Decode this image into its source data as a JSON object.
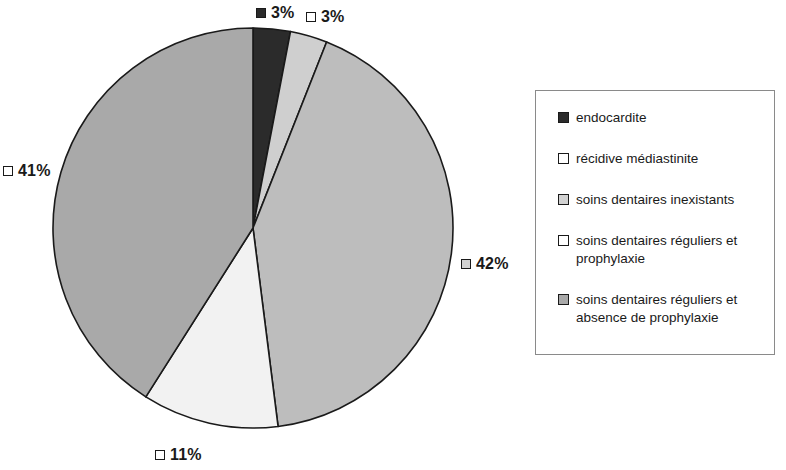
{
  "chart_data": {
    "type": "pie",
    "title": "",
    "subtitle": "",
    "xlabel": "",
    "ylabel": "",
    "grid": false,
    "legend_position": "right",
    "start_angle_deg": 0,
    "direction": "clockwise",
    "units": "percent",
    "categories": [
      "endocardite",
      "récidive médiastinite",
      "soins dentaires inexistants",
      "soins dentaires réguliers et prophylaxie",
      "soins dentaires réguliers et absence de prophylaxie"
    ],
    "values": [
      3,
      3,
      42,
      11,
      41
    ],
    "data_labels": [
      "3%",
      "3%",
      "42%",
      "11%",
      "41%"
    ],
    "colors": [
      "#2b2b2b",
      "#cfcfcf",
      "#bdbdbd",
      "#f2f2f2",
      "#a9a9a9"
    ],
    "slice_border_color": "#1a1a1a",
    "slices": [
      {
        "label": "endocardite",
        "value": 3,
        "data_label": "3%",
        "color": "#2b2b2b"
      },
      {
        "label": "récidive médiastinite",
        "value": 3,
        "data_label": "3%",
        "color": "#cfcfcf"
      },
      {
        "label": "soins dentaires inexistants",
        "value": 42,
        "data_label": "42%",
        "color": "#bdbdbd"
      },
      {
        "label": "soins dentaires réguliers et prophylaxie",
        "value": 11,
        "data_label": "11%",
        "color": "#f2f2f2"
      },
      {
        "label": "soins dentaires réguliers et absence de prophylaxie",
        "value": 41,
        "data_label": "41%",
        "color": "#a9a9a9"
      }
    ]
  },
  "labels": {
    "endocardite_pct": "3%",
    "recidive_pct": "3%",
    "inexistants_pct": "42%",
    "prophylaxie_pct": "11%",
    "absence_pct": "41%"
  },
  "legend": {
    "items": [
      {
        "label": "endocardite",
        "color": "#2b2b2b"
      },
      {
        "label": "récidive médiastinite",
        "color": "#ffffff"
      },
      {
        "label": "soins dentaires inexistants",
        "color": "#d2d2d2"
      },
      {
        "label": "soins dentaires réguliers et prophylaxie",
        "color": "#ffffff"
      },
      {
        "label": "soins dentaires réguliers et absence de prophylaxie",
        "color": "#a9a9a9"
      }
    ]
  }
}
